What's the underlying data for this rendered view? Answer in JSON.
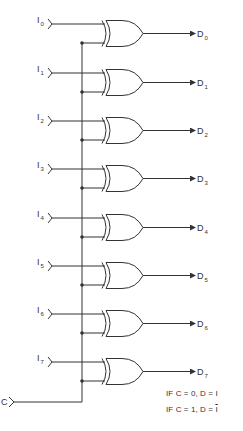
{
  "diagram": {
    "title": "",
    "colors": {
      "line": "#333333",
      "background": "#ffffff"
    },
    "control_input": {
      "label": "C"
    },
    "gate_type": "XOR",
    "rows": [
      {
        "input": "I",
        "input_sub": "0",
        "output": "D",
        "output_sub": "0"
      },
      {
        "input": "I",
        "input_sub": "1",
        "output": "D",
        "output_sub": "1"
      },
      {
        "input": "I",
        "input_sub": "2",
        "output": "D",
        "output_sub": "2"
      },
      {
        "input": "I",
        "input_sub": "3",
        "output": "D",
        "output_sub": "3"
      },
      {
        "input": "I",
        "input_sub": "4",
        "output": "D",
        "output_sub": "4"
      },
      {
        "input": "I",
        "input_sub": "5",
        "output": "D",
        "output_sub": "5"
      },
      {
        "input": "I",
        "input_sub": "6",
        "output": "D",
        "output_sub": "6"
      },
      {
        "input": "I",
        "input_sub": "7",
        "output": "D",
        "output_sub": "7"
      }
    ],
    "conditions": [
      {
        "prefix": "IF C = 0, D = ",
        "value": "I",
        "inverted": false
      },
      {
        "prefix": "IF C = 1, D = ",
        "value": "I",
        "inverted": true
      }
    ]
  }
}
